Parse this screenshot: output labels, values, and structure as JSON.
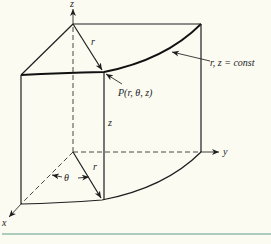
{
  "figure": {
    "type": "cylindrical coordinate system diagram",
    "labels": {
      "z_axis": "z",
      "y_axis": "y",
      "x_axis": "x",
      "radius_top": "r",
      "radius_bottom": "r",
      "height": "z",
      "angle": "θ",
      "point": "P(r, θ, z)",
      "surface": "r, z = const"
    },
    "colors": {
      "background": "#fbfbf2",
      "lines": "#1e1e1e",
      "rule": "#5f9a8a"
    }
  }
}
